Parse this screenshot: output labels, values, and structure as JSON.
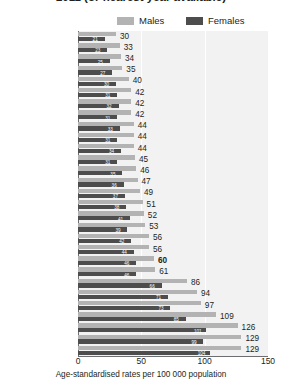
{
  "title": "2011 (or nearest year available)",
  "legend": {
    "position": "top-center",
    "items": [
      {
        "label": "Males",
        "color": "#b3b3b3"
      },
      {
        "label": "Females",
        "color": "#4d4d4d"
      }
    ]
  },
  "axis": {
    "xlabel": "Age-standardised rates per 100 000 population",
    "ticks": [
      "0",
      "50",
      "100",
      "150"
    ],
    "tick_values": [
      0,
      50,
      100,
      150
    ],
    "xlim": [
      0,
      150
    ]
  },
  "chart_data": {
    "type": "bar",
    "orientation": "horizontal",
    "title": "2011 (or nearest year available)",
    "xlabel": "Age-standardised rates per 100 000 population",
    "ylabel": "",
    "xlim": [
      0,
      150
    ],
    "grid": true,
    "legend_position": "top-center",
    "categories": [
      "Switzerland",
      "France",
      "Canada",
      "United States",
      "Ireland",
      "Austria",
      "Netherlands",
      "Australia",
      "Norway",
      "New Zealand",
      "Germany",
      "Iceland",
      "Sweden",
      "Mexico",
      "Spain",
      "United Kingdom",
      "Italy",
      "Luxembourg",
      "Denmark",
      "Finland",
      "OECD",
      "Japan",
      "Greece",
      "Slovak Republic",
      "Poland",
      "Korea",
      "Czech Republic",
      "Portugal",
      "Hungary"
    ],
    "series": [
      {
        "name": "Males",
        "color": "#b3b3b3",
        "values": [
          30,
          33,
          34,
          35,
          40,
          42,
          42,
          42,
          44,
          44,
          44,
          45,
          46,
          47,
          49,
          51,
          52,
          53,
          56,
          56,
          60,
          61,
          86,
          94,
          97,
          109,
          126,
          129,
          129
        ]
      },
      {
        "name": "Females",
        "color": "#4d4d4d",
        "values": [
          21,
          23,
          25,
          27,
          30,
          31,
          32,
          31,
          33,
          31,
          34,
          31,
          35,
          36,
          37,
          38,
          41,
          39,
          42,
          44,
          46,
          46,
          66,
          71,
          73,
          85,
          101,
          99,
          104
        ]
      }
    ],
    "labels": [
      "30",
      "33",
      "34",
      "35",
      "40",
      "42",
      "42",
      "42",
      "44",
      "44",
      "44",
      "45",
      "46",
      "47",
      "49",
      "51",
      "52",
      "53",
      "56",
      "56",
      "60",
      "61",
      "86",
      "94",
      "97",
      "109",
      "126",
      "129",
      "129"
    ],
    "highlight_category": "OECD"
  }
}
